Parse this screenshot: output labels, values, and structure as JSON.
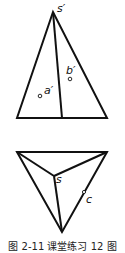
{
  "figure": {
    "caption": "图 2-11  课堂练习 12 图",
    "front_view": {
      "apex_label": "s′",
      "points": [
        {
          "label": "a′"
        },
        {
          "label": "b′"
        }
      ]
    },
    "top_view": {
      "apex_label": "s",
      "points": [
        {
          "label": "c"
        }
      ]
    },
    "colors": {
      "line": "#111111",
      "background": "#ffffff"
    }
  }
}
